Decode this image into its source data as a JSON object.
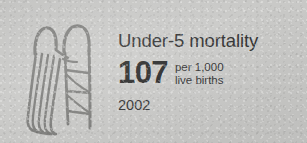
{
  "card": {
    "background_color": "#c9c9c7",
    "text_color": "#2f2f2f",
    "illustration_stroke_color": "#7b7b78"
  },
  "indicator": {
    "title": "Under-5 mortality",
    "value": "107",
    "unit_line_1": "per 1,000",
    "unit_line_2": "live births",
    "year": "2002"
  },
  "illustration": {
    "name": "playground-slide-illustration",
    "description": "hand-drawn playground slide with ladder"
  }
}
